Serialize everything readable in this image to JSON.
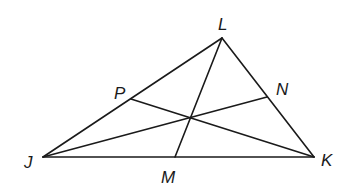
{
  "diagram": {
    "type": "triangle-medians",
    "stroke_color": "#1a1a1a",
    "background": "#ffffff",
    "points": {
      "J": {
        "x": 43,
        "y": 157
      },
      "K": {
        "x": 314,
        "y": 157
      },
      "L": {
        "x": 222,
        "y": 38
      },
      "M": {
        "x": 175,
        "y": 157
      },
      "N": {
        "x": 267,
        "y": 97
      },
      "P": {
        "x": 131,
        "y": 99
      },
      "centroid": {
        "x": 189,
        "y": 118
      }
    },
    "labels": {
      "L": {
        "text": "L",
        "x": 218,
        "y": 30
      },
      "J": {
        "text": "J",
        "x": 24,
        "y": 168
      },
      "K": {
        "text": "K",
        "x": 321,
        "y": 166
      },
      "M": {
        "text": "M",
        "x": 161,
        "y": 183
      },
      "N": {
        "text": "N",
        "x": 276,
        "y": 95
      },
      "P": {
        "text": "P",
        "x": 114,
        "y": 99
      }
    },
    "segments": [
      {
        "name": "side-JK",
        "from": "J",
        "to": "K"
      },
      {
        "name": "side-KL",
        "from": "K",
        "to": "L"
      },
      {
        "name": "side-LJ",
        "from": "L",
        "to": "J"
      },
      {
        "name": "median-LM",
        "from": "L",
        "to": "M"
      },
      {
        "name": "median-JN",
        "from": "J",
        "to": "N"
      },
      {
        "name": "median-KP",
        "from": "K",
        "to": "P"
      }
    ]
  }
}
